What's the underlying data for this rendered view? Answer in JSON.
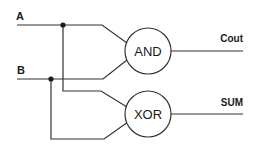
{
  "diagram": {
    "inputs": [
      {
        "id": "A",
        "label": "A"
      },
      {
        "id": "B",
        "label": "B"
      }
    ],
    "gates": [
      {
        "id": "and",
        "label": "AND",
        "inputs": [
          "A",
          "B"
        ],
        "output": "Cout"
      },
      {
        "id": "xor",
        "label": "XOR",
        "inputs": [
          "A",
          "B"
        ],
        "output": "SUM"
      }
    ],
    "outputs": [
      {
        "id": "cout",
        "label": "Cout"
      },
      {
        "id": "sum",
        "label": "SUM"
      }
    ],
    "colors": {
      "line": "#333333",
      "text": "#1a1a1a",
      "background": "#ffffff"
    }
  }
}
